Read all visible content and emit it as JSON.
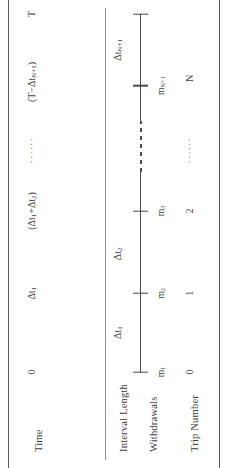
{
  "figure": {
    "orientation": "rotated-90-ccw",
    "background": "#ffffff",
    "ink_color": "#3d3d3d",
    "rule_color": "#5a5a5a"
  },
  "row_labels": {
    "time": "Time",
    "interval_length": "Interval Length",
    "withdrawals": "Withdrawals",
    "trip_number": "Trip Number"
  },
  "time_row": [
    {
      "text": "0",
      "pos": 0
    },
    {
      "text": "Δt",
      "sub": "1",
      "pos": 22
    },
    {
      "text": "(Δt",
      "sub": "1",
      "text2": "+Δt",
      "sub2": "2",
      "text3": ")",
      "pos": 45
    },
    {
      "text": "······",
      "pos": 62,
      "kind": "dots"
    },
    {
      "text": "(T−Δt",
      "sub": "N+1",
      "text2": ")",
      "pos": 80
    },
    {
      "text": "T",
      "pos": 100
    }
  ],
  "interval_row": [
    {
      "text": "Δt",
      "sub": "1",
      "pos": 11
    },
    {
      "text": "Δt",
      "sub": "2",
      "pos": 33
    },
    {
      "text": "Δt",
      "sub": "N+1",
      "pos": 90
    }
  ],
  "withdrawals_row": [
    {
      "text": "m",
      "sub": "1",
      "pos": 0
    },
    {
      "text": "m",
      "sub": "2",
      "pos": 22
    },
    {
      "text": "m",
      "sub": "3",
      "pos": 45
    },
    {
      "text": "m",
      "sub": "N+1",
      "pos": 80
    }
  ],
  "trip_row": [
    {
      "text": "0",
      "pos": 0
    },
    {
      "text": "1",
      "pos": 22
    },
    {
      "text": "2",
      "pos": 45
    },
    {
      "text": "······",
      "pos": 62,
      "kind": "dots"
    },
    {
      "text": "N",
      "pos": 82
    }
  ],
  "axis": {
    "ticks": [
      0,
      22,
      45,
      80,
      100
    ],
    "dashed_segment": [
      56,
      70
    ]
  }
}
